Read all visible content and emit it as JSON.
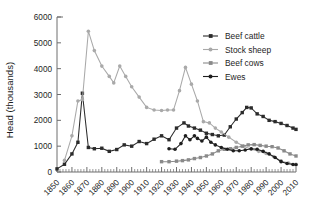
{
  "chart_data": {
    "type": "line",
    "title": "",
    "xlabel": "",
    "ylabel": "Head (thousands)",
    "xlim": [
      1850,
      2010
    ],
    "ylim": [
      0,
      6000
    ],
    "yticks": [
      0,
      1000,
      2000,
      3000,
      4000,
      5000,
      6000
    ],
    "ytick_labels": [
      "0",
      "1000",
      "2000",
      "3000",
      "4000",
      "5000",
      "6000"
    ],
    "xticks": [
      1850,
      1860,
      1870,
      1880,
      1890,
      1900,
      1910,
      1920,
      1930,
      1940,
      1950,
      1960,
      1970,
      1980,
      1990,
      2000,
      2010
    ],
    "xtick_labels": [
      "1850",
      "1860",
      "1870",
      "1880",
      "1890",
      "1900",
      "1910",
      "1920",
      "1930",
      "1940",
      "1950",
      "1960",
      "1970",
      "1980",
      "1990",
      "2000",
      "2010"
    ],
    "minor_tick_interval": 2,
    "grid": false,
    "legend_position": "upper right",
    "series": [
      {
        "name": "Beef cattle",
        "color": "#2b2b2b",
        "marker": "square",
        "points": [
          [
            1850,
            120
          ],
          [
            1855,
            300
          ],
          [
            1860,
            700
          ],
          [
            1864,
            1150
          ],
          [
            1867,
            3050
          ],
          [
            1871,
            950
          ],
          [
            1875,
            900
          ],
          [
            1880,
            920
          ],
          [
            1885,
            800
          ],
          [
            1890,
            870
          ],
          [
            1895,
            1050
          ],
          [
            1900,
            1000
          ],
          [
            1905,
            1180
          ],
          [
            1910,
            1100
          ],
          [
            1915,
            1270
          ],
          [
            1920,
            1400
          ],
          [
            1925,
            1250
          ],
          [
            1930,
            1700
          ],
          [
            1935,
            1900
          ],
          [
            1938,
            1780
          ],
          [
            1942,
            1700
          ],
          [
            1946,
            1620
          ],
          [
            1950,
            1500
          ],
          [
            1954,
            1450
          ],
          [
            1958,
            1400
          ],
          [
            1962,
            1430
          ],
          [
            1966,
            1750
          ],
          [
            1970,
            2050
          ],
          [
            1974,
            2300
          ],
          [
            1977,
            2500
          ],
          [
            1980,
            2480
          ],
          [
            1984,
            2250
          ],
          [
            1988,
            2150
          ],
          [
            1992,
            2000
          ],
          [
            1996,
            1950
          ],
          [
            2000,
            1880
          ],
          [
            2004,
            1800
          ],
          [
            2008,
            1700
          ],
          [
            2010,
            1650
          ]
        ]
      },
      {
        "name": "Stock sheep",
        "color": "#a9a9a9",
        "marker": "circle",
        "points": [
          [
            1855,
            450
          ],
          [
            1860,
            1400
          ],
          [
            1864,
            2750
          ],
          [
            1867,
            2800
          ],
          [
            1871,
            5450
          ],
          [
            1875,
            4700
          ],
          [
            1880,
            4100
          ],
          [
            1885,
            3700
          ],
          [
            1888,
            3450
          ],
          [
            1892,
            4100
          ],
          [
            1896,
            3700
          ],
          [
            1900,
            3300
          ],
          [
            1905,
            2900
          ],
          [
            1910,
            2500
          ],
          [
            1915,
            2400
          ],
          [
            1920,
            2380
          ],
          [
            1924,
            2400
          ],
          [
            1928,
            2400
          ],
          [
            1932,
            3150
          ],
          [
            1936,
            4050
          ],
          [
            1940,
            3400
          ],
          [
            1944,
            2750
          ],
          [
            1948,
            1950
          ],
          [
            1952,
            1900
          ],
          [
            1956,
            1700
          ],
          [
            1960,
            1550
          ],
          [
            1965,
            1350
          ],
          [
            1970,
            1150
          ],
          [
            1975,
            1000
          ],
          [
            1980,
            880
          ],
          [
            1985,
            800
          ],
          [
            1990,
            720
          ],
          [
            1995,
            600
          ],
          [
            2000,
            430
          ],
          [
            2005,
            350
          ],
          [
            2010,
            300
          ]
        ]
      },
      {
        "name": "Beef cows",
        "color": "#8a8a8a",
        "marker": "square",
        "points": [
          [
            1920,
            400
          ],
          [
            1925,
            400
          ],
          [
            1930,
            420
          ],
          [
            1934,
            440
          ],
          [
            1938,
            470
          ],
          [
            1942,
            520
          ],
          [
            1946,
            560
          ],
          [
            1950,
            620
          ],
          [
            1954,
            700
          ],
          [
            1958,
            820
          ],
          [
            1962,
            880
          ],
          [
            1966,
            900
          ],
          [
            1970,
            950
          ],
          [
            1974,
            1000
          ],
          [
            1978,
            1050
          ],
          [
            1982,
            1060
          ],
          [
            1986,
            1030
          ],
          [
            1990,
            1000
          ],
          [
            1994,
            980
          ],
          [
            1998,
            930
          ],
          [
            2002,
            820
          ],
          [
            2006,
            700
          ],
          [
            2010,
            620
          ]
        ]
      },
      {
        "name": "Ewes",
        "color": "#1e1e1e",
        "marker": "circle",
        "points": [
          [
            1925,
            900
          ],
          [
            1929,
            880
          ],
          [
            1933,
            1100
          ],
          [
            1936,
            1400
          ],
          [
            1939,
            1250
          ],
          [
            1942,
            1400
          ],
          [
            1944,
            1300
          ],
          [
            1947,
            1200
          ],
          [
            1950,
            1350
          ],
          [
            1953,
            1150
          ],
          [
            1956,
            1050
          ],
          [
            1960,
            950
          ],
          [
            1964,
            880
          ],
          [
            1968,
            820
          ],
          [
            1972,
            820
          ],
          [
            1976,
            850
          ],
          [
            1980,
            900
          ],
          [
            1984,
            880
          ],
          [
            1988,
            800
          ],
          [
            1992,
            700
          ],
          [
            1996,
            560
          ],
          [
            2000,
            400
          ],
          [
            2004,
            330
          ],
          [
            2008,
            290
          ],
          [
            2010,
            280
          ]
        ]
      }
    ]
  },
  "legend": {
    "items": [
      {
        "label": "Beef cattle"
      },
      {
        "label": "Stock sheep"
      },
      {
        "label": "Beef cows"
      },
      {
        "label": "Ewes"
      }
    ]
  }
}
